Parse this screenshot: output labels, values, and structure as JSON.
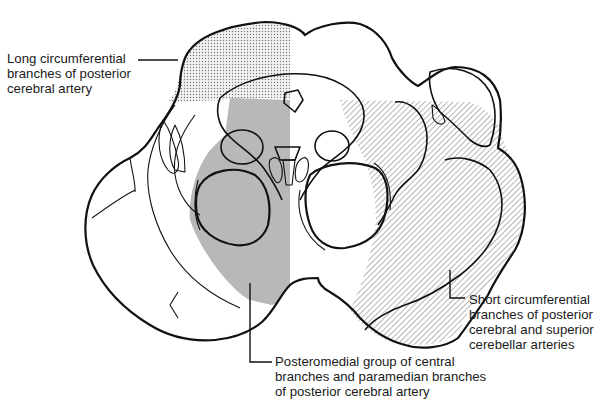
{
  "figure": {
    "type": "anatomical cross-section",
    "colors": {
      "outline": "#111111",
      "posteromedial_fill": "#b5b5b5",
      "long_circumferential_pattern": "stippled",
      "short_circumferential_pattern": "diagonal hatching",
      "background": "#ffffff"
    }
  },
  "labels": {
    "long_circumferential": {
      "lines": [
        "Long circumferential",
        "branches of posterior",
        "cerebral artery"
      ],
      "pattern": "stippled dots"
    },
    "short_circumferential": {
      "lines": [
        "Short circumferential",
        "branches of posterior",
        "cerebral and superior",
        "cerebellar arteries"
      ],
      "pattern": "diagonal hatching"
    },
    "posteromedial": {
      "lines": [
        "Posteromedial group of central",
        "branches and paramedian branches",
        "of posterior cerebral artery"
      ],
      "pattern": "solid gray"
    }
  }
}
